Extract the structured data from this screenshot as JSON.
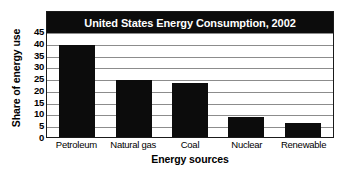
{
  "chart_data": {
    "type": "bar",
    "title": "United States Energy Consumption, 2002",
    "xlabel": "Energy sources",
    "ylabel": "Share of energy use",
    "categories": [
      "Petroleum",
      "Natural gas",
      "Coal",
      "Nuclear",
      "Renewable"
    ],
    "values": [
      39,
      24,
      23,
      8.5,
      6
    ],
    "ylim": [
      0,
      45
    ],
    "ytick_values": [
      0,
      5,
      10,
      15,
      20,
      25,
      30,
      35,
      40,
      45
    ],
    "ytick_labels": [
      "0",
      "5",
      "10",
      "15",
      "20",
      "25",
      "30",
      "35",
      "40",
      "45"
    ],
    "grid": true,
    "legend": null,
    "legend_position": "none",
    "bar_color": "#0c0c0c",
    "title_bar_color": "#0c0c0c",
    "title_text_color": "#ffffff",
    "grid_color": "#8c8c8c",
    "axis_color": "#1a1a1a",
    "background_color": "#ffffff"
  }
}
